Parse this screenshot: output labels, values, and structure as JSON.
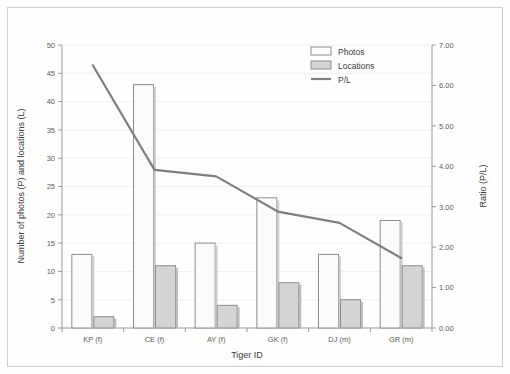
{
  "chart_data": {
    "type": "bar",
    "title": "",
    "xlabel": "Tiger ID",
    "ylabel": "Number of photos (P) and locations (L)",
    "y2label": "Ratio (P/L)",
    "categories": [
      "KP (f)",
      "CE (f)",
      "AY (f)",
      "GK (f)",
      "DJ (m)",
      "GR (m)"
    ],
    "series": [
      {
        "name": "Photos",
        "type": "bar",
        "axis": "left",
        "values": [
          13,
          43,
          15,
          23,
          13,
          19
        ],
        "color": "#fbfbfb",
        "edge": "#8d8d8d"
      },
      {
        "name": "Locations",
        "type": "bar",
        "axis": "left",
        "values": [
          2,
          11,
          4,
          8,
          5,
          11
        ],
        "color": "#d4d4d4",
        "edge": "#8d8d8d"
      },
      {
        "name": "P/L",
        "type": "line",
        "axis": "right",
        "values": [
          6.5,
          3.91,
          3.75,
          2.88,
          2.6,
          1.73
        ],
        "color": "#808080"
      }
    ],
    "ylim": [
      0,
      50
    ],
    "yticks": [
      0,
      5,
      10,
      15,
      20,
      25,
      30,
      35,
      40,
      45,
      50
    ],
    "ytick_labels": [
      "0",
      "5",
      "10",
      "15",
      "20",
      "25",
      "30",
      "35",
      "40",
      "45",
      "50"
    ],
    "y2lim": [
      0,
      7
    ],
    "y2ticks": [
      0,
      1,
      2,
      3,
      4,
      5,
      6,
      7
    ],
    "y2tick_labels": [
      "0.00",
      "1.00",
      "2.00",
      "3.00",
      "4.00",
      "5.00",
      "6.00",
      "7.00"
    ],
    "grid": true,
    "legend_position": "top-center-right",
    "legend": [
      {
        "label": "Photos",
        "marker": "box-open"
      },
      {
        "label": "Locations",
        "marker": "box-filled"
      },
      {
        "label": "P/L",
        "marker": "line"
      }
    ]
  },
  "colors": {
    "axis": "#9a9a9a",
    "grid": "#f0f0f0",
    "text": "#4a4a4a",
    "line": "#808080",
    "bar_photos_fill": "#fbfbfb",
    "bar_locations_fill": "#d4d4d4",
    "bar_edge": "#8d8d8d",
    "frame": "#cfcfcf",
    "background": "#fefefe"
  }
}
